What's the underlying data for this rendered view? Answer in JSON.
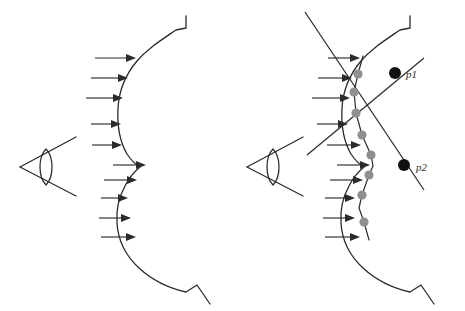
{
  "figure": {
    "title": "",
    "background_color": "#ffffff",
    "width": 465,
    "height": 311,
    "line_color": "#2b2b2b",
    "sample_dot_color": "#8f8f8f",
    "vertex_dot_color": "#111111"
  },
  "panels": [
    {
      "id": "left-panel",
      "name": "smooth-surface-panel",
      "description": "eye viewing a smooth wavy silhouette with incident light arrows",
      "eye": {
        "name": "eye-icon",
        "apex_x": 20,
        "apex_y": 167,
        "upper_arm_end_x": 76,
        "upper_arm_end_y": 137,
        "lower_arm_end_x": 76,
        "lower_arm_end_y": 196,
        "pupil_cx": 46,
        "pupil_cy": 167
      },
      "surface": {
        "name": "smooth-surface-curve",
        "path": "M 186 16 L 186 28 L 176 30 C 160 41 147 49 137 61 C 126 74 119 90 118 108 C 117 126 120 142 127 154 C 131 160 135 164 140 167 C 135 171 129 178 125 186 C 119 197 116 210 117 223 C 118 240 126 256 139 268 C 152 280 168 288 186 292 L 197 285 L 210 304"
      },
      "arrow_count": 10,
      "arrows": [
        {
          "x1": 95,
          "y1": 58,
          "x2": 136,
          "y2": 58
        },
        {
          "x1": 91,
          "y1": 78,
          "x2": 128,
          "y2": 78
        },
        {
          "x1": 86,
          "y1": 98,
          "x2": 123,
          "y2": 98
        },
        {
          "x1": 91,
          "y1": 124,
          "x2": 121,
          "y2": 124
        },
        {
          "x1": 92,
          "y1": 145,
          "x2": 122,
          "y2": 145
        },
        {
          "x1": 113,
          "y1": 165,
          "x2": 146,
          "y2": 165
        },
        {
          "x1": 104,
          "y1": 180,
          "x2": 137,
          "y2": 180
        },
        {
          "x1": 101,
          "y1": 198,
          "x2": 128,
          "y2": 198
        },
        {
          "x1": 99,
          "y1": 218,
          "x2": 131,
          "y2": 218
        },
        {
          "x1": 101,
          "y1": 237,
          "x2": 136,
          "y2": 237
        }
      ]
    },
    {
      "id": "right-panel",
      "name": "polygonal-approximation-panel",
      "description": "eye viewing the same silhouette approximated by a polyline through sampled points, with visibility rays through vertices p1 and p2",
      "eye": {
        "name": "eye-icon",
        "apex_x": 247,
        "apex_y": 167,
        "upper_arm_end_x": 303,
        "upper_arm_end_y": 137,
        "lower_arm_end_x": 303,
        "lower_arm_end_y": 196,
        "pupil_cx": 273,
        "pupil_cy": 167
      },
      "surface": {
        "name": "polygonal-surface-curve",
        "path": "M 410 16 L 410 28 L 400 30 C 384 41 371 49 361 61 C 350 74 343 90 342 108 C 341 126 344 142 351 154 C 355 160 359 164 364 167 C 359 171 353 178 349 186 C 343 197 340 210 341 223 C 342 240 350 256 363 268 C 376 280 392 288 410 292 L 421 285 L 434 304"
      },
      "approximation_polyline": {
        "name": "sampled-polyline",
        "points": "363,56 358,74 354,92 355,110 359,128 366,146 372,160 373,168 368,178 363,190 361,206 363,222 368,238"
      },
      "sample_points": [
        {
          "name": "sample-dot",
          "cx": 358,
          "cy": 74,
          "color": "#8f8f8f"
        },
        {
          "name": "sample-dot",
          "cx": 354,
          "cy": 92,
          "color": "#8f8f8f"
        },
        {
          "name": "sample-dot",
          "cx": 356,
          "cy": 113,
          "color": "#8f8f8f"
        },
        {
          "name": "sample-dot",
          "cx": 362,
          "cy": 135,
          "color": "#8f8f8f"
        },
        {
          "name": "sample-dot",
          "cx": 371,
          "cy": 155,
          "color": "#8f8f8f"
        },
        {
          "name": "sample-dot",
          "cx": 369,
          "cy": 175,
          "color": "#8f8f8f"
        },
        {
          "name": "sample-dot",
          "cx": 362,
          "cy": 195,
          "color": "#8f8f8f"
        },
        {
          "name": "sample-dot",
          "cx": 364,
          "cy": 222,
          "color": "#8f8f8f"
        }
      ],
      "vertices": [
        {
          "name": "vertex-p1",
          "label": "p1",
          "cx": 395,
          "cy": 73,
          "label_x": 406,
          "label_y": 78,
          "color": "#111111"
        },
        {
          "name": "vertex-p2",
          "label": "p2",
          "cx": 404,
          "cy": 165,
          "label_x": 416,
          "label_y": 172,
          "color": "#111111"
        }
      ],
      "rays": [
        {
          "name": "ray-through-p1",
          "x1": 305,
          "y1": 12,
          "x2": 424,
          "y2": 190
        },
        {
          "name": "ray-through-p2",
          "x1": 307,
          "y1": 155,
          "x2": 424,
          "y2": 58
        }
      ],
      "arrow_count": 10,
      "arrows": [
        {
          "x1": 328,
          "y1": 58,
          "x2": 360,
          "y2": 58
        },
        {
          "x1": 318,
          "y1": 78,
          "x2": 352,
          "y2": 78
        },
        {
          "x1": 312,
          "y1": 98,
          "x2": 350,
          "y2": 98
        },
        {
          "x1": 317,
          "y1": 124,
          "x2": 348,
          "y2": 124
        },
        {
          "x1": 327,
          "y1": 145,
          "x2": 361,
          "y2": 145
        },
        {
          "x1": 337,
          "y1": 165,
          "x2": 370,
          "y2": 165
        },
        {
          "x1": 330,
          "y1": 180,
          "x2": 363,
          "y2": 180
        },
        {
          "x1": 325,
          "y1": 198,
          "x2": 355,
          "y2": 198
        },
        {
          "x1": 323,
          "y1": 218,
          "x2": 355,
          "y2": 218
        },
        {
          "x1": 325,
          "y1": 237,
          "x2": 360,
          "y2": 237
        }
      ]
    }
  ]
}
